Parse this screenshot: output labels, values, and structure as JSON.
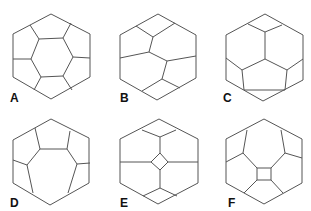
{
  "figure": {
    "panels": [
      {
        "label": "A",
        "description": "hexagon with central hexagon and six surrounding cells"
      },
      {
        "label": "B",
        "description": "hexagon subdivided into irregular cells"
      },
      {
        "label": "C",
        "description": "hexagon subdivided into three pentagons and side cells"
      },
      {
        "label": "D",
        "description": "hexagon with large central heptagon-like cell"
      },
      {
        "label": "E",
        "description": "hexagon with small central diamond"
      },
      {
        "label": "F",
        "description": "hexagon with small central square"
      }
    ]
  }
}
